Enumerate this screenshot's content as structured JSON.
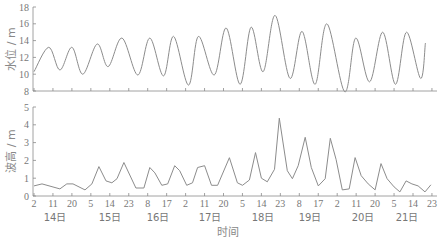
{
  "chart_data": [
    {
      "type": "line",
      "title": "",
      "xlabel": "时间",
      "ylabel": "水位 / m",
      "ylim": [
        8,
        18
      ],
      "yticks": [
        "8",
        "10",
        "12",
        "14",
        "16",
        "18"
      ],
      "grid": false,
      "series": [
        {
          "name": "水位",
          "points": [
            [
              0,
              10.3
            ],
            [
              7.0,
              13.2
            ],
            [
              12.3,
              10.5
            ],
            [
              18.0,
              13.2
            ],
            [
              23.2,
              10.0
            ],
            [
              30.0,
              13.6
            ],
            [
              35.2,
              10.9
            ],
            [
              41.8,
              14.3
            ],
            [
              49.3,
              9.9
            ],
            [
              55.0,
              14.3
            ],
            [
              61.5,
              9.8
            ],
            [
              66.3,
              14.5
            ],
            [
              73.4,
              8.7
            ],
            [
              78.1,
              14.5
            ],
            [
              85.6,
              9.9
            ],
            [
              91.3,
              15.5
            ],
            [
              97.9,
              8.8
            ],
            [
              103.1,
              15.6
            ],
            [
              108.8,
              10.3
            ],
            [
              114.5,
              17.0
            ],
            [
              121.6,
              9.5
            ],
            [
              127.3,
              15.1
            ],
            [
              133.5,
              8.8
            ],
            [
              139.1,
              16.0
            ],
            [
              147.6,
              7.9
            ],
            [
              152.8,
              14.3
            ],
            [
              159.4,
              9.1
            ],
            [
              165.6,
              15.0
            ],
            [
              171.7,
              8.8
            ],
            [
              176.9,
              15.0
            ],
            [
              183.6,
              9.5
            ],
            [
              185.9,
              13.7
            ]
          ]
        }
      ]
    },
    {
      "type": "line",
      "title": "",
      "xlabel": "时间",
      "ylabel": "波高 / m",
      "ylim": [
        0,
        5
      ],
      "yticks": [
        "0",
        "1",
        "2",
        "3",
        "4",
        "5"
      ],
      "grid": false,
      "series": [
        {
          "name": "波高",
          "points": [
            [
              0,
              0.57
            ],
            [
              3.8,
              0.68
            ],
            [
              12.3,
              0.4
            ],
            [
              15.6,
              0.68
            ],
            [
              18.5,
              0.68
            ],
            [
              24.2,
              0.34
            ],
            [
              27.5,
              0.68
            ],
            [
              30.8,
              1.65
            ],
            [
              34.2,
              0.85
            ],
            [
              37.0,
              0.74
            ],
            [
              39.4,
              0.97
            ],
            [
              42.7,
              1.88
            ],
            [
              48.4,
              0.45
            ],
            [
              52.2,
              0.45
            ],
            [
              55.0,
              1.6
            ],
            [
              57.4,
              1.3
            ],
            [
              60.7,
              0.6
            ],
            [
              63.5,
              0.68
            ],
            [
              66.8,
              1.7
            ],
            [
              69.2,
              1.42
            ],
            [
              72.5,
              0.6
            ],
            [
              75.3,
              0.74
            ],
            [
              77.7,
              1.6
            ],
            [
              81.0,
              1.7
            ],
            [
              84.3,
              0.6
            ],
            [
              87.2,
              0.6
            ],
            [
              92.8,
              2.15
            ],
            [
              96.6,
              0.74
            ],
            [
              99.0,
              0.6
            ],
            [
              102.3,
              0.9
            ],
            [
              105.2,
              2.44
            ],
            [
              108.0,
              1.0
            ],
            [
              110.8,
              0.8
            ],
            [
              114.2,
              1.5
            ],
            [
              116.5,
              4.37
            ],
            [
              120.3,
              1.42
            ],
            [
              122.7,
              0.97
            ],
            [
              125.5,
              1.7
            ],
            [
              128.8,
              3.3
            ],
            [
              131.7,
              1.6
            ],
            [
              135.0,
              0.57
            ],
            [
              138.3,
              0.97
            ],
            [
              140.7,
              3.24
            ],
            [
              143.5,
              2.05
            ],
            [
              146.4,
              0.34
            ],
            [
              149.7,
              0.4
            ],
            [
              152.5,
              2.16
            ],
            [
              155.4,
              1.14
            ],
            [
              158.7,
              0.68
            ],
            [
              162.0,
              0.34
            ],
            [
              164.8,
              1.82
            ],
            [
              167.7,
              0.97
            ],
            [
              171.0,
              0.51
            ],
            [
              173.8,
              0.23
            ],
            [
              176.7,
              0.85
            ],
            [
              179.5,
              0.68
            ],
            [
              182.4,
              0.57
            ],
            [
              185.7,
              0.23
            ],
            [
              188.5,
              0.63
            ]
          ]
        }
      ]
    }
  ],
  "x_axis": {
    "unit_note": "hours since 14日 02:00",
    "ticks": [
      "2",
      "11",
      "20",
      "5",
      "14",
      "23",
      "8",
      "17",
      "2",
      "11",
      "20",
      "5",
      "14",
      "23",
      "8",
      "17",
      "2",
      "11",
      "20",
      "5",
      "14",
      "23"
    ],
    "days": [
      "14日",
      "15日",
      "16日",
      "17日",
      "18日",
      "19日",
      "20日",
      "21日"
    ],
    "title": "时间"
  },
  "top_panel": {
    "ylabel": "水位 / m",
    "ytick_labels": [
      "8",
      "10",
      "12",
      "14",
      "16",
      "18"
    ]
  },
  "bottom_panel": {
    "ylabel": "波高 / m",
    "ytick_labels": [
      "0",
      "1",
      "2",
      "3",
      "4",
      "5"
    ]
  },
  "colors": {
    "line": "#8c8c8c",
    "axis": "#8a8a8a",
    "text": "#777777"
  }
}
